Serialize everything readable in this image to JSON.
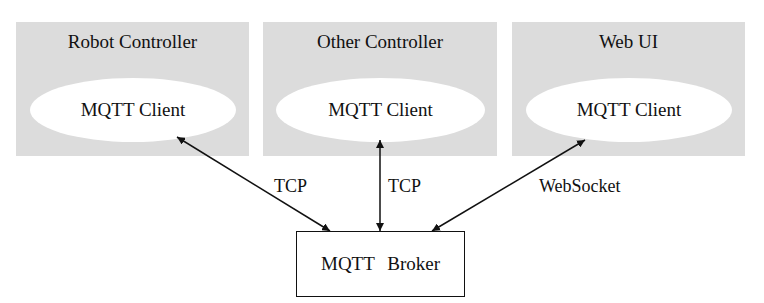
{
  "controllers": [
    {
      "title": "Robot Controller",
      "client": "MQTT Client"
    },
    {
      "title": "Other Controller",
      "client": "MQTT Client"
    },
    {
      "title": "Web UI",
      "client": "MQTT Client"
    }
  ],
  "broker": {
    "label": "MQTT Broker"
  },
  "connections": [
    {
      "label": "TCP",
      "from": "Robot Controller",
      "to": "MQTT Broker",
      "bidirectional": true
    },
    {
      "label": "TCP",
      "from": "Other Controller",
      "to": "MQTT Broker",
      "bidirectional": true
    },
    {
      "label": "WebSocket",
      "from": "Web UI",
      "to": "MQTT Broker",
      "bidirectional": true
    }
  ],
  "colors": {
    "container_fill": "#dcdcdc",
    "client_fill": "#ffffff",
    "line": "#111111"
  }
}
